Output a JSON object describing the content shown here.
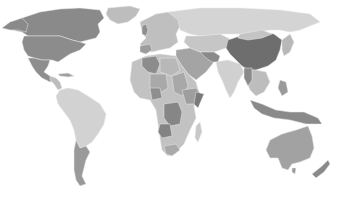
{
  "map": {
    "title": "",
    "projection": "world-miller-like",
    "background": "#ffffff",
    "palette": {
      "darkest": "#6b6b6b",
      "dark": "#878787",
      "mid": "#a3a3a3",
      "light": "#c4c4c4",
      "lightest": "#d8d8d8",
      "border": "#eeeeee"
    },
    "regions": [
      {
        "name": "Canada",
        "shade": "dark"
      },
      {
        "name": "United States",
        "shade": "dark"
      },
      {
        "name": "Greenland",
        "shade": "light"
      },
      {
        "name": "Mexico",
        "shade": "dark"
      },
      {
        "name": "Central America",
        "shade": "light"
      },
      {
        "name": "Brazil",
        "shade": "lightest"
      },
      {
        "name": "Argentina",
        "shade": "dark"
      },
      {
        "name": "South America (other)",
        "shade": "lightest"
      },
      {
        "name": "Europe",
        "shade": "light"
      },
      {
        "name": "Russia",
        "shade": "lightest"
      },
      {
        "name": "Algeria",
        "shade": "dark"
      },
      {
        "name": "Africa (other)",
        "shade": "light"
      },
      {
        "name": "DR Congo",
        "shade": "dark"
      },
      {
        "name": "Angola",
        "shade": "dark"
      },
      {
        "name": "Middle East",
        "shade": "mid"
      },
      {
        "name": "India",
        "shade": "lightest"
      },
      {
        "name": "China",
        "shade": "darkest"
      },
      {
        "name": "Southeast Asia",
        "shade": "light"
      },
      {
        "name": "Indonesia",
        "shade": "dark"
      },
      {
        "name": "Australia",
        "shade": "mid"
      },
      {
        "name": "New Zealand",
        "shade": "dark"
      }
    ]
  }
}
